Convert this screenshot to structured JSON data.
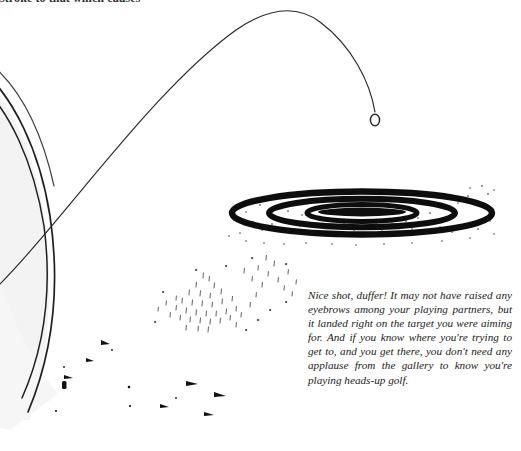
{
  "page": {
    "width": 521,
    "height": 451,
    "background_color": "#ffffff",
    "ink_color": "#1a1a1a"
  },
  "cut_heading": {
    "text": "stroke to that which causes"
  },
  "caption": {
    "text": "Nice shot, duffer! It may not have raised any eyebrows among your playing partners, but it landed right on the target you were aiming for. And if you know where you're trying to get to, and you get there, you don't need any applause from the gallery to know you're playing heads-up golf."
  },
  "illustration": {
    "title": "golf-ball-landing-on-target-illustration",
    "elements": [
      {
        "name": "ball-flight-trajectory",
        "label": "Ball flight arc"
      },
      {
        "name": "golf-ball",
        "label": "Golf ball",
        "cx": 375,
        "cy": 120,
        "rx": 5,
        "ry": 6
      },
      {
        "name": "target-rings",
        "label": "Concentric target rings",
        "cx": 362,
        "cy": 213,
        "ring_count": 3
      },
      {
        "name": "target-bullseye",
        "label": "Filled bullseye center"
      },
      {
        "name": "green-edge-outer-arc",
        "label": "Outer green contour"
      },
      {
        "name": "green-edge-inner-arc",
        "label": "Inner green contour"
      },
      {
        "name": "grass-speckles",
        "label": "Scattered grass marks"
      }
    ],
    "target": {
      "cx": 362,
      "cy": 213,
      "rings": [
        {
          "rx": 130,
          "ry": 22,
          "stroke": 6
        },
        {
          "rx": 93,
          "ry": 14.5,
          "stroke": 6
        },
        {
          "rx": 55,
          "ry": 8,
          "stroke": 5
        }
      ],
      "bullseye": {
        "rx": 44,
        "ry": 4.5
      }
    }
  }
}
